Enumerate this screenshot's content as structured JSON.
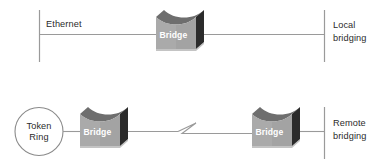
{
  "diagram": {
    "colors": {
      "background": "#ffffff",
      "line": "#9a9a9a",
      "text": "#2b2b2b",
      "bridge_front": "#9d9d9d",
      "bridge_front_light": "#b9b9b9",
      "bridge_side": "#2e2e2e",
      "bridge_top": "#6e6e6e",
      "bridge_label": "#ffffff",
      "ring_stroke": "#8a8a8a"
    },
    "rows": [
      {
        "id": "local-bridging-row",
        "caption_line1": "Local",
        "caption_line2": "bridging",
        "segment_label": "Ethernet",
        "nodes": [
          {
            "id": "bridge-1",
            "label": "Bridge",
            "icon": "bridge-icon"
          }
        ],
        "terminators": [
          "vertical-bar-left",
          "vertical-bar-right"
        ]
      },
      {
        "id": "remote-bridging-row",
        "caption_line1": "Remote",
        "caption_line2": "bridging",
        "endpoint": {
          "id": "token-ring",
          "label_line1": "Token",
          "label_line2": "Ring",
          "shape": "circle"
        },
        "link_break": {
          "id": "wan-break-symbol",
          "shape": "zigzag"
        },
        "nodes": [
          {
            "id": "bridge-2",
            "label": "Bridge",
            "icon": "bridge-icon"
          },
          {
            "id": "bridge-3",
            "label": "Bridge",
            "icon": "bridge-icon"
          }
        ],
        "terminators": [
          "vertical-bar-right"
        ]
      }
    ]
  }
}
